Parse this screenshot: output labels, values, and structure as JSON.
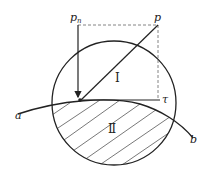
{
  "diagram": {
    "labels": {
      "p": "p",
      "pn": "p",
      "pn_sub": "n",
      "tau": "τ",
      "a": "a",
      "b": "b",
      "region1": "Ⅰ",
      "region2": "Ⅱ"
    },
    "colors": {
      "stroke": "#222222",
      "hatch": "#555555",
      "dashed": "#666666"
    }
  }
}
